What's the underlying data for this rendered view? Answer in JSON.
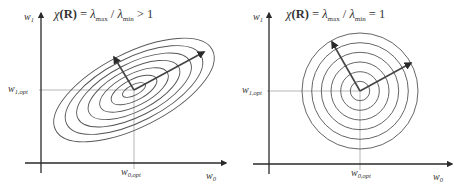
{
  "colors": {
    "axis": "#2a2a2a",
    "contour": "#555555",
    "guide": "#999999",
    "arrow": "#444444",
    "text": "#333333"
  },
  "panels": [
    {
      "id": "elliptic",
      "title": {
        "chi": "χ",
        "R": "(R)",
        "eq": " = ",
        "lambda1": "λ",
        "sub1": "max",
        "slash": " / ",
        "lambda2": "λ",
        "sub2": "min",
        "relation": " > 1"
      },
      "y_axis_label": {
        "base": "w",
        "sub": "1"
      },
      "x_axis_label": {
        "base": "w",
        "sub": "0"
      },
      "y_opt_label": {
        "base": "w",
        "sub": "1,opt"
      },
      "x_opt_label": {
        "base": "w",
        "sub": "0,opt"
      },
      "origin": [
        41,
        163
      ],
      "x_axis_end": 229,
      "y_axis_top": 10,
      "center": [
        134,
        90
      ],
      "contours": {
        "shape": "ellipse",
        "count": 7,
        "rotation_deg": -27,
        "max_rx": 88,
        "max_ry": 37
      },
      "arrows": [
        {
          "to": [
            114,
            57
          ]
        },
        {
          "to": [
            204,
            52
          ]
        }
      ]
    },
    {
      "id": "circular",
      "title": {
        "chi": "χ",
        "R": "(R)",
        "eq": " = ",
        "lambda1": "λ",
        "sub1": "max",
        "slash": " / ",
        "lambda2": "λ",
        "sub2": "min",
        "relation": " = 1"
      },
      "y_axis_label": {
        "base": "w",
        "sub": "1"
      },
      "x_axis_label": {
        "base": "w",
        "sub": "0"
      },
      "y_opt_label": {
        "base": "w",
        "sub": "1,opt"
      },
      "x_opt_label": {
        "base": "w",
        "sub": "0,opt"
      },
      "origin": [
        269,
        164
      ],
      "x_axis_end": 455,
      "y_axis_top": 10,
      "center": [
        360,
        91
      ],
      "contours": {
        "shape": "circle",
        "count": 6,
        "max_r": 58
      },
      "arrows": [
        {
          "to": [
            332,
            42
          ]
        },
        {
          "to": [
            411,
            63
          ]
        }
      ]
    }
  ]
}
